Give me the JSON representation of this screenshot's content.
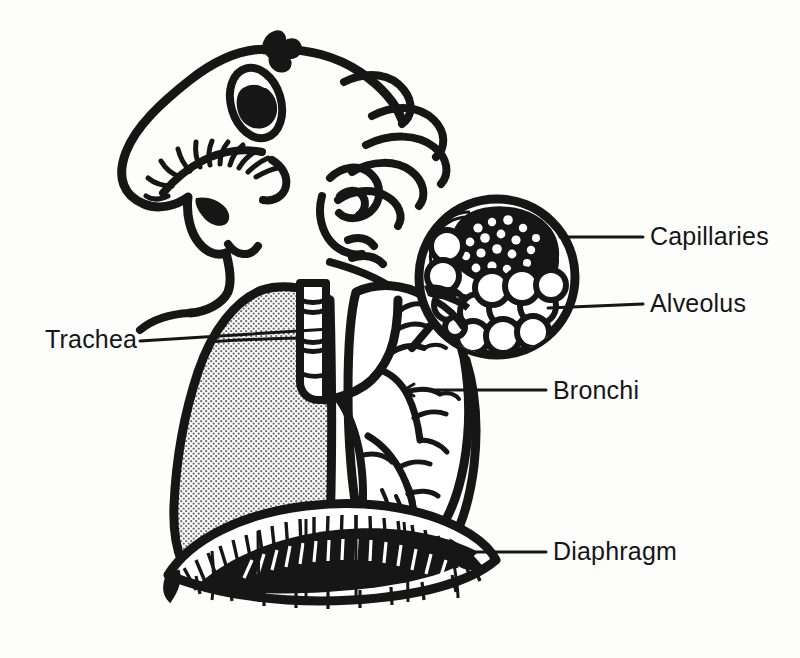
{
  "figure": {
    "background_color": "#fdfdfc",
    "ink_color": "#161616",
    "stipple_color": "#8d8d8d"
  },
  "labels": [
    {
      "id": "trachea",
      "text": "Trachea",
      "side": "left",
      "points_to": "trachea-tube"
    },
    {
      "id": "capillaries",
      "text": "Capillaries",
      "side": "right",
      "points_to": "capillary-network"
    },
    {
      "id": "alveolus",
      "text": "Alveolus",
      "side": "right",
      "points_to": "alveoli-cluster"
    },
    {
      "id": "bronchi",
      "text": "Bronchi",
      "side": "right",
      "points_to": "bronchial-tree"
    },
    {
      "id": "diaphragm",
      "text": "Diaphragm",
      "side": "right",
      "points_to": "diaphragm-dome"
    }
  ],
  "parts": {
    "head": "cartoon-head-profile",
    "hair": "wavy-hair-strands",
    "ear": "ear-spiral",
    "eye": "eye-with-long-lashes",
    "nose": "large-nose",
    "mouth": "open-mouth",
    "left_lung": "stippled-lung",
    "right_lung": "cutaway-lung-with-bronchial-tree",
    "trachea": "ringed-windpipe",
    "diaphragm": "domed-muscle-with-radiating-fibers",
    "inset": "magnified-alveolus-circle"
  }
}
